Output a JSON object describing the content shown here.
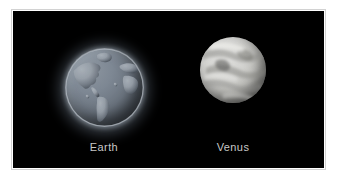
{
  "figure": {
    "panel_background": "#000000",
    "frame_color": "#ffffff",
    "frame_border_color": "#d2d2d2",
    "label_color": "#c8c8c8"
  },
  "planets": [
    {
      "id": "earth",
      "label": "Earth",
      "appearance": "blue-gray globe with continents and glowing atmospheric halo",
      "body_color": "#6b747f",
      "halo_color": "#becce0"
    },
    {
      "id": "venus",
      "label": "Venus",
      "appearance": "pale gray-white sphere with swirling cloud bands",
      "body_color": "#cfcfcb",
      "halo_color": "#000000"
    }
  ]
}
